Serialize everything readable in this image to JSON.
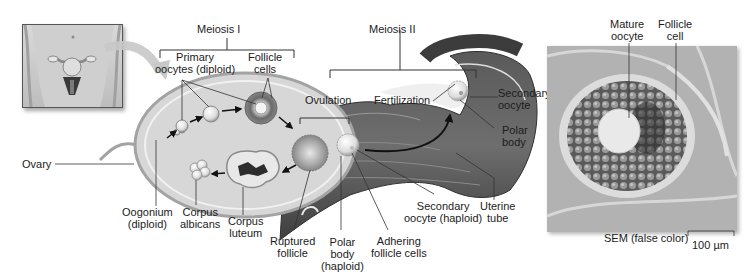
{
  "figure": {
    "type": "biology-diagram"
  },
  "brackets": {
    "meiosis_1": "Meiosis I",
    "meiosis_2": "Meiosis II"
  },
  "labels": {
    "primary_oocytes": [
      "Primary",
      "oocytes (diploid)"
    ],
    "follicle_cells": [
      "Follicle",
      "cells"
    ],
    "ovulation": "Ovulation",
    "fertilization": "Fertilization",
    "secondary_oocyte_top": [
      "Secondary",
      "oocyte"
    ],
    "polar_body_top": [
      "Polar",
      "body"
    ],
    "ovary": "Ovary",
    "oogonium": [
      "Oogonium",
      "(diploid)"
    ],
    "corpus_albicans": [
      "Corpus",
      "albicans"
    ],
    "corpus_luteum": [
      "Corpus",
      "luteum"
    ],
    "ruptured_follicle": [
      "Ruptured",
      "follicle"
    ],
    "polar_body_haploid": [
      "Polar",
      "body",
      "(haploid)"
    ],
    "adhering_follicle_cells": [
      "Adhering",
      "follicle cells"
    ],
    "secondary_oocyte_haploid": [
      "Secondary",
      "oocyte (haploid)"
    ],
    "uterine_tube": [
      "Uterine",
      "tube"
    ]
  },
  "micrograph": {
    "mature_oocyte": [
      "Mature",
      "oocyte"
    ],
    "follicle_cell": [
      "Follicle",
      "cell"
    ],
    "caption": "SEM (false color)",
    "scale_bar": "100 µm"
  },
  "colors": {
    "ovary_fill": "#d8d8d8",
    "ovary_edge": "#9a9a9a",
    "tube_dark": "#4a4a4a",
    "tube_mid": "#6b6b6b",
    "cell_light": "#f2f2f2",
    "leader_line": "#333333"
  }
}
